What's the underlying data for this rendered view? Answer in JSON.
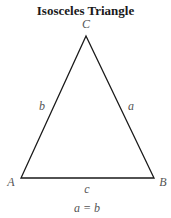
{
  "title": "Isosceles Triangle",
  "vertices": {
    "apex": "C",
    "left": "A",
    "right": "B"
  },
  "sides": {
    "left": "b",
    "right": "a",
    "base": "c"
  },
  "caption": "a = b",
  "colors": {
    "stroke": "#1a1a1a",
    "label": "#555555"
  }
}
